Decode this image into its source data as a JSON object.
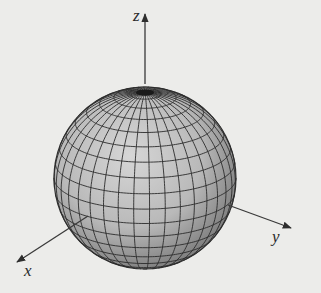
{
  "figure": {
    "background_color": "#ececea",
    "sphere": {
      "center": [
        145,
        178
      ],
      "radius": 91,
      "tilt_degrees": 20,
      "meridian_count": 36,
      "parallel_count": 18,
      "fill_light": "#cfcfcf",
      "fill_dark": "#7a7a7a",
      "grid_color": "#2b2b2b"
    },
    "axes": {
      "color": "#3a3a3a",
      "z": {
        "label": "z",
        "start": [
          145,
          84
        ],
        "end": [
          145,
          14
        ]
      },
      "x": {
        "label": "x",
        "start": [
          88,
          216
        ],
        "end": [
          17,
          262
        ]
      },
      "y": {
        "label": "y",
        "start": [
          228,
          205
        ],
        "end": [
          291,
          228
        ]
      }
    },
    "labels": {
      "z": "z",
      "x": "x",
      "y": "y"
    }
  }
}
